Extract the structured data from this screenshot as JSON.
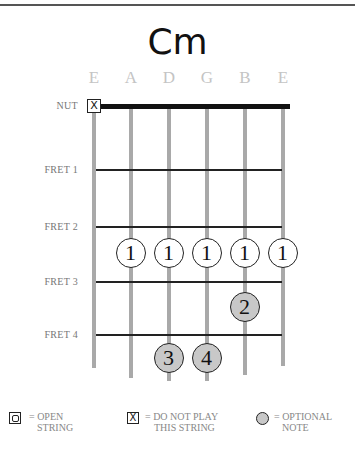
{
  "chord": {
    "name": "Cm"
  },
  "strings": [
    {
      "label": "E",
      "x": 94,
      "end_y": 368
    },
    {
      "label": "A",
      "x": 131,
      "end_y": 378
    },
    {
      "label": "D",
      "x": 169,
      "end_y": 381
    },
    {
      "label": "G",
      "x": 207,
      "end_y": 381
    },
    {
      "label": "B",
      "x": 245,
      "end_y": 375
    },
    {
      "label": "E",
      "x": 283,
      "end_y": 366
    }
  ],
  "frets": [
    {
      "label": "NUT",
      "y": 106
    },
    {
      "label": "FRET 1",
      "y": 170
    },
    {
      "label": "FRET 2",
      "y": 227
    },
    {
      "label": "FRET 3",
      "y": 282
    },
    {
      "label": "FRET 4",
      "y": 335
    }
  ],
  "muted_string": {
    "string": "E",
    "symbol": "X"
  },
  "fingers": [
    {
      "finger": "1",
      "string": "A",
      "fret": 3,
      "optional": false
    },
    {
      "finger": "1",
      "string": "D",
      "fret": 3,
      "optional": false
    },
    {
      "finger": "1",
      "string": "G",
      "fret": 3,
      "optional": false
    },
    {
      "finger": "1",
      "string": "B",
      "fret": 3,
      "optional": false
    },
    {
      "finger": "1",
      "string": "E",
      "fret": 3,
      "optional": false
    },
    {
      "finger": "2",
      "string": "B",
      "fret": 4,
      "optional": true
    },
    {
      "finger": "3",
      "string": "D",
      "fret": 5,
      "optional": true
    },
    {
      "finger": "4",
      "string": "G",
      "fret": 5,
      "optional": true
    }
  ],
  "legend": {
    "open": {
      "line1": "= OPEN",
      "line2": "STRING"
    },
    "mute": {
      "symbol": "X",
      "line1": "= DO NOT PLAY",
      "line2": "THIS STRING"
    },
    "optional": {
      "line1": "= OPTIONAL",
      "line2": "NOTE"
    }
  },
  "colors": {
    "string": "#a9a9a9",
    "fret": "#222222",
    "nut": "#111111",
    "optional_fill": "#c8c8c8",
    "label_gray": "#c4c4c4"
  }
}
